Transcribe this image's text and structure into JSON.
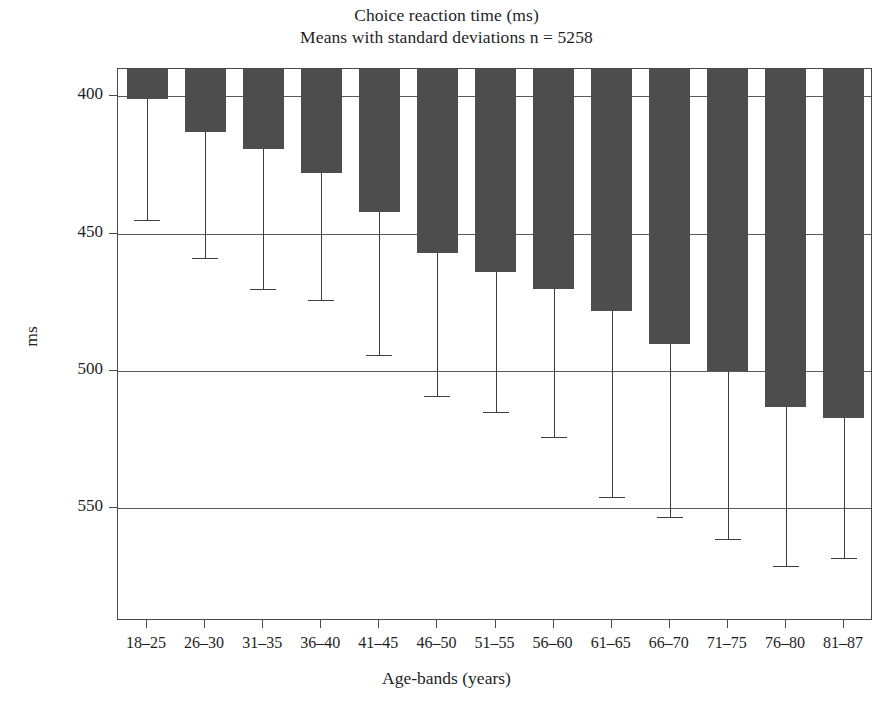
{
  "chart_data": {
    "type": "bar",
    "title": "Choice reaction time (ms)",
    "subtitle": "Means with standard deviations n = 5258",
    "xlabel": "Age-bands (years)",
    "ylabel": "ms",
    "y_inverted": true,
    "ylim": [
      390,
      591
    ],
    "yticks": [
      400,
      450,
      500,
      550
    ],
    "ytick_labels": [
      "400",
      "450",
      "500",
      "550"
    ],
    "grid": "horizontal",
    "legend": "none",
    "n": 5258,
    "error_type": "standard deviation",
    "error_direction": "upper-only (drawn toward slower times)",
    "categories": [
      "18–25",
      "26–30",
      "31–35",
      "36–40",
      "41–45",
      "46–50",
      "51–55",
      "56–60",
      "61–65",
      "66–70",
      "71–75",
      "76–80",
      "81–87"
    ],
    "values": [
      401,
      413,
      419,
      428,
      442,
      457,
      464,
      470,
      478,
      490,
      500,
      513,
      517
    ],
    "errors_upper": [
      445,
      459,
      470,
      474,
      494,
      509,
      515,
      524,
      546,
      553,
      561,
      571,
      568
    ],
    "series": [
      {
        "name": "Mean choice reaction time",
        "values": [
          401,
          413,
          419,
          428,
          442,
          457,
          464,
          470,
          478,
          490,
          500,
          513,
          517
        ]
      },
      {
        "name": "Mean + standard deviation",
        "values": [
          445,
          459,
          470,
          474,
          494,
          509,
          515,
          524,
          546,
          553,
          561,
          571,
          568
        ]
      }
    ],
    "colors": {
      "bar": "#4d4d4d",
      "error": "#3d3d3d",
      "grid": "#5a5a5a",
      "axis": "#4a4a4a",
      "background": "#ffffff",
      "text": "#1e1e1e"
    }
  }
}
